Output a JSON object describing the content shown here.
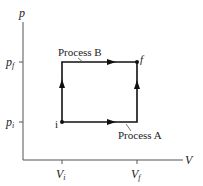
{
  "diagram": {
    "axes": {
      "y_label": "p",
      "x_label": "V",
      "y_ticks": [
        {
          "main": "p",
          "sub": "f"
        },
        {
          "main": "p",
          "sub": "i"
        }
      ],
      "x_ticks": [
        {
          "main": "V",
          "sub": "i"
        },
        {
          "main": "V",
          "sub": "f"
        }
      ]
    },
    "points": {
      "initial": "i",
      "final": "f"
    },
    "processes": {
      "a": "Process A",
      "b": "Process B"
    },
    "colors": {
      "line": "#111111",
      "axis": "#555555"
    }
  }
}
